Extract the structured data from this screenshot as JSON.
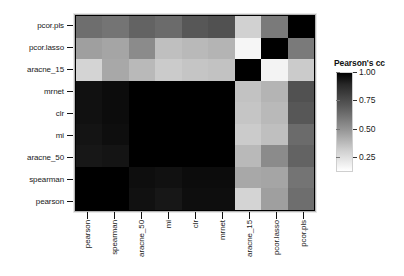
{
  "chart_data": {
    "type": "heatmap",
    "title": "",
    "xlabel": "",
    "ylabel": "",
    "legend": {
      "title": "Pearson's cc",
      "position": "right",
      "ticks": [
        1.0,
        0.75,
        0.5,
        0.25
      ],
      "tick_labels": [
        "1.00",
        "0.75",
        "0.50",
        "0.25"
      ],
      "vmin": 0.12,
      "vmax": 1.0,
      "colormap": "grayscale-reversed",
      "low_color": "#ffffff",
      "high_color": "#000000"
    },
    "x_categories": [
      "pearson",
      "spearman",
      "aracne_50",
      "mi",
      "clr",
      "mrnet",
      "aracne_15",
      "pcor.lasso",
      "pcor.pls"
    ],
    "y_categories": [
      "pcor.pls",
      "pcor.lasso",
      "aracne_15",
      "mrnet",
      "clr",
      "mi",
      "aracne_50",
      "spearman",
      "pearson"
    ],
    "grid": false,
    "values": [
      [
        0.62,
        0.6,
        0.66,
        0.63,
        0.7,
        0.72,
        0.28,
        0.58,
        1.0
      ],
      [
        0.45,
        0.43,
        0.52,
        0.34,
        0.36,
        0.38,
        0.15,
        1.0,
        0.58
      ],
      [
        0.27,
        0.42,
        0.36,
        0.3,
        0.32,
        0.33,
        1.0,
        0.16,
        0.3
      ],
      [
        0.94,
        0.96,
        1.0,
        1.0,
        1.0,
        1.0,
        0.33,
        0.38,
        0.72
      ],
      [
        0.94,
        0.96,
        1.0,
        1.0,
        1.0,
        1.0,
        0.32,
        0.36,
        0.7
      ],
      [
        0.93,
        0.95,
        1.0,
        1.0,
        1.0,
        1.0,
        0.3,
        0.34,
        0.63
      ],
      [
        0.92,
        0.93,
        1.0,
        1.0,
        1.0,
        1.0,
        0.36,
        0.52,
        0.66
      ],
      [
        1.0,
        1.0,
        0.95,
        0.94,
        0.96,
        0.96,
        0.42,
        0.43,
        0.6
      ],
      [
        1.0,
        1.0,
        0.94,
        0.92,
        0.95,
        0.95,
        0.27,
        0.45,
        0.62
      ]
    ]
  }
}
